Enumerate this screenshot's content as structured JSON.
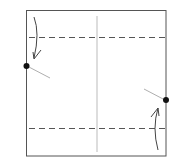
{
  "diagram": {
    "type": "origami-fold-step",
    "colors": {
      "paper_edge": "#555555",
      "crease": "#999999",
      "dashed_valley": "#555555",
      "arrow": "#444444",
      "dot": "#111111",
      "reference_line": "#999999"
    },
    "paper": {
      "x": 26,
      "y": 10,
      "width": 140,
      "height": 146
    },
    "center_crease": {
      "x": 97,
      "y1": 16,
      "y2": 152
    },
    "valley_folds": [
      {
        "name": "top-valley-fold",
        "y": 37
      },
      {
        "name": "bottom-valley-fold",
        "y": 128
      }
    ],
    "points": [
      {
        "name": "left-reference-point",
        "x": 26,
        "y": 66
      },
      {
        "name": "right-reference-point",
        "x": 166,
        "y": 100
      }
    ],
    "arrows": [
      {
        "name": "fold-down-arrow",
        "direction": "down"
      },
      {
        "name": "fold-up-arrow",
        "direction": "up"
      }
    ]
  }
}
